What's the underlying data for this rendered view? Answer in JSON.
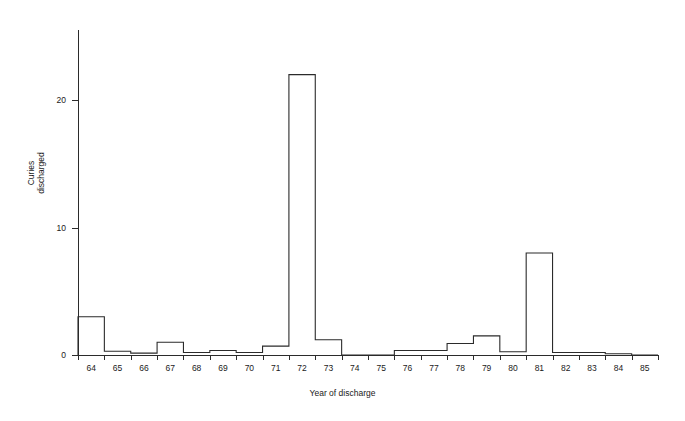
{
  "chart_data": {
    "type": "bar",
    "title": "",
    "subtitle": "",
    "xlabel": "Year of discharge",
    "ylabel_line1": "Curies",
    "ylabel_line2": "discharged",
    "ylabel": "Curies discharged",
    "categories": [
      "64",
      "65",
      "66",
      "67",
      "68",
      "69",
      "70",
      "71",
      "72",
      "73",
      "74",
      "75",
      "76",
      "77",
      "78",
      "79",
      "80",
      "81",
      "82",
      "83",
      "84",
      "85"
    ],
    "values": [
      3.0,
      0.3,
      0.15,
      1.0,
      0.2,
      0.35,
      0.2,
      0.7,
      22.0,
      1.2,
      0.0,
      0.0,
      0.35,
      0.35,
      0.9,
      1.5,
      0.25,
      8.0,
      0.2,
      0.2,
      0.1,
      0.0
    ],
    "ytick_labels": [
      "0",
      "10",
      "20"
    ],
    "ytick_values": [
      0,
      10,
      20
    ],
    "ylim": [
      0,
      25.5
    ],
    "xlim": [
      "64",
      "85"
    ],
    "grid": false,
    "legend": null,
    "legend_position": "none",
    "series_color": "#2b2b2b",
    "axis_color": "#2b2b2b",
    "background": "#ffffff",
    "style": "step-outline-unfilled"
  }
}
